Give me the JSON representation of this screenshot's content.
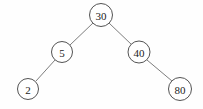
{
  "figure": {
    "background_color": "#fefefe",
    "node_fill_color": "#ffffff",
    "node_stroke_color": "#4a4a4a",
    "edge_color": "#6e6e6e",
    "label_color": "#1c1c1c",
    "width": 203,
    "height": 109
  },
  "chart_data": {
    "type": "diagram",
    "diagram_kind": "binary-search-tree",
    "title": "",
    "nodes": [
      {
        "id": "n30",
        "label": "30",
        "cx": 101,
        "cy": 15,
        "r": 11.5,
        "font_size": 11,
        "role": "root"
      },
      {
        "id": "n5",
        "label": "5",
        "cx": 62,
        "cy": 52,
        "r": 10.5,
        "font_size": 11,
        "role": "left-child"
      },
      {
        "id": "n40",
        "label": "40",
        "cx": 139,
        "cy": 52,
        "r": 11.0,
        "font_size": 11,
        "role": "right-child"
      },
      {
        "id": "n2",
        "label": "2",
        "cx": 28,
        "cy": 89,
        "r": 10.5,
        "font_size": 11,
        "role": "leaf"
      },
      {
        "id": "n80",
        "label": "80",
        "cx": 180,
        "cy": 89,
        "r": 11.5,
        "font_size": 11,
        "role": "leaf"
      }
    ],
    "edges": [
      {
        "id": "e30-5",
        "from": "n30",
        "to": "n5",
        "x1": 93,
        "y1": 23,
        "x2": 70,
        "y2": 45
      },
      {
        "id": "e30-40",
        "from": "n30",
        "to": "n40",
        "x1": 109,
        "y1": 23,
        "x2": 132,
        "y2": 45
      },
      {
        "id": "e5-2",
        "from": "n5",
        "to": "n2",
        "x1": 55,
        "y1": 60,
        "x2": 36,
        "y2": 81
      },
      {
        "id": "e40-80",
        "from": "n40",
        "to": "n80",
        "x1": 147,
        "y1": 60,
        "x2": 172,
        "y2": 81
      }
    ],
    "labels": [
      "30",
      "5",
      "40",
      "2",
      "80"
    ]
  }
}
